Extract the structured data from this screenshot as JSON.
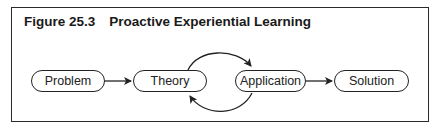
{
  "figure": {
    "number": "Figure 25.3",
    "title": "Proactive Experiential Learning"
  },
  "nodes": [
    {
      "id": "problem",
      "label": "Problem"
    },
    {
      "id": "theory",
      "label": "Theory"
    },
    {
      "id": "application",
      "label": "Application"
    },
    {
      "id": "solution",
      "label": "Solution"
    }
  ],
  "edges": [
    {
      "from": "problem",
      "to": "theory"
    },
    {
      "from": "theory",
      "to": "application",
      "style": "curved-top"
    },
    {
      "from": "application",
      "to": "theory",
      "style": "curved-bottom"
    },
    {
      "from": "application",
      "to": "solution"
    }
  ],
  "colors": {
    "stroke": "#222222",
    "background": "#ffffff"
  }
}
